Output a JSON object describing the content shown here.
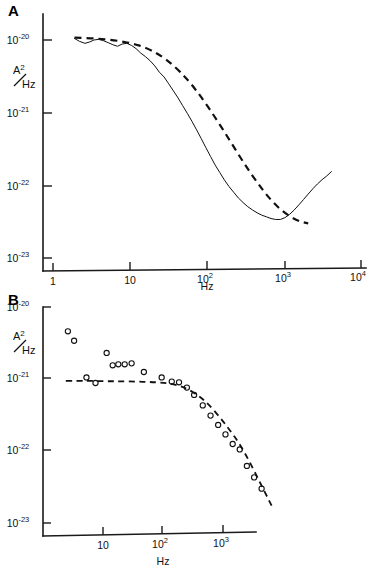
{
  "figure": {
    "background": "#ffffff",
    "ink_color": "#111111"
  },
  "panels": [
    {
      "id": "A",
      "letter": "A",
      "ylabel_numerator": "A",
      "ylabel_numerator_sup": "2",
      "ylabel_denominator": "Hz",
      "xlabel": "Hz",
      "y_tick_labels": [
        "-20",
        "-21",
        "-22",
        "-23"
      ],
      "y_tick_base": "10",
      "x_tick_labels": [
        "1",
        "10",
        "10",
        "10",
        "10"
      ],
      "x_tick_exponents": [
        "",
        "",
        "2",
        "3",
        "4"
      ]
    },
    {
      "id": "B",
      "letter": "B",
      "ylabel_numerator": "A",
      "ylabel_numerator_sup": "2",
      "ylabel_denominator": "Hz",
      "xlabel": "Hz",
      "y_tick_labels": [
        "-20",
        "-21",
        "-22",
        "-23"
      ],
      "y_tick_base": "10",
      "x_tick_labels": [
        "10",
        "10",
        "10"
      ],
      "x_tick_exponents": [
        "",
        "2",
        "3"
      ]
    }
  ],
  "chart_data": [
    {
      "type": "line",
      "panel": "A",
      "title": "A",
      "xlabel": "Hz",
      "ylabel": "A^2/Hz",
      "xscale": "log",
      "yscale": "log",
      "xlim": [
        1,
        10000
      ],
      "ylim": [
        1e-23,
        1e-20
      ],
      "x_ticks": [
        1,
        10,
        100,
        1000,
        10000
      ],
      "y_ticks": [
        1e-20,
        1e-21,
        1e-22,
        1e-23
      ],
      "grid": false,
      "legend": "none",
      "series": [
        {
          "name": "measured spectrum",
          "style": "solid-noisy",
          "x": [
            1.9,
            2.2,
            2.6,
            3.0,
            3.4,
            3.9,
            4.5,
            5.2,
            6.0,
            6.9,
            7.9,
            9.1,
            10.5,
            12.0,
            13.8,
            15.9,
            18.2,
            21.0,
            24.1,
            27.7,
            31.8,
            36.6,
            42.0,
            48.3,
            55.5,
            63.8,
            73.3,
            84.2,
            96.8,
            111.2,
            127.8,
            146.9,
            168.8,
            194.0,
            223.0,
            256.2,
            294.4,
            338.3,
            388.8,
            446.8,
            513.4,
            590.0,
            678.0,
            779.1,
            895.4,
            1029.0,
            1182.5,
            1358.9,
            1561.6,
            1794.6,
            2062.3,
            2370.0,
            2723.5,
            3129.8,
            3596.6,
            4133.0
          ],
          "y": [
            1.05e-20,
            9.6e-21,
            9e-21,
            9.4e-21,
            1e-20,
            1.02e-20,
            9.8e-21,
            9.2e-21,
            8.6e-21,
            8.2e-21,
            8.8e-21,
            9e-21,
            8.4e-21,
            7.6e-21,
            6.6e-21,
            5.9e-21,
            5.2e-21,
            4.4e-21,
            3.6e-21,
            3.1e-21,
            2.5e-21,
            2e-21,
            1.6e-21,
            1.25e-21,
            9.8e-22,
            7.6e-22,
            5.8e-22,
            4.4e-22,
            3.3e-22,
            2.5e-22,
            1.9e-22,
            1.5e-22,
            1.18e-22,
            9.6e-23,
            8e-23,
            6.7e-23,
            5.8e-23,
            5.1e-23,
            4.6e-23,
            4.2e-23,
            3.9e-23,
            3.7e-23,
            3.5e-23,
            3.4e-23,
            3.4e-23,
            3.6e-23,
            4e-23,
            4.6e-23,
            5.4e-23,
            6.4e-23,
            7.6e-23,
            9e-23,
            1.05e-22,
            1.2e-22,
            1.35e-22,
            1.55e-22
          ]
        },
        {
          "name": "lorentzian fit",
          "style": "dashed",
          "x": [
            1.9,
            3.0,
            4.5,
            6.9,
            10.5,
            15.9,
            24.1,
            36.6,
            55.5,
            84.2,
            127.8,
            194.0,
            294.4,
            446.8,
            678.0,
            1029.0,
            1561.6,
            2062.3
          ],
          "y": [
            1.08e-20,
            1.06e-20,
            1.03e-20,
            9.8e-21,
            9e-21,
            7.9e-21,
            6.3e-21,
            4.5e-21,
            2.9e-21,
            1.65e-21,
            8.6e-22,
            4.3e-22,
            2.1e-22,
            1.1e-22,
            6.2e-23,
            4.1e-23,
            3.2e-23,
            3e-23
          ]
        }
      ]
    },
    {
      "type": "scatter",
      "panel": "B",
      "title": "B",
      "xlabel": "Hz",
      "ylabel": "A^2/Hz",
      "xscale": "log",
      "yscale": "log",
      "xlim": [
        2,
        8000
      ],
      "ylim": [
        1e-23,
        1e-20
      ],
      "x_ticks": [
        10,
        100,
        1000
      ],
      "y_ticks": [
        1e-20,
        1e-21,
        1e-22,
        1e-23
      ],
      "grid": false,
      "legend": "none",
      "series": [
        {
          "name": "measured points",
          "style": "open-circles",
          "x": [
            2.6,
            3.3,
            5.3,
            7.5,
            11.5,
            14.5,
            18.0,
            23.0,
            30.0,
            48.0,
            95.0,
            140.0,
            185.0,
            250.0,
            330.0,
            460.0,
            620.0,
            830.0,
            1100.0,
            1450.0,
            1900.0,
            2500.0,
            3300.0,
            4400.0
          ],
          "y": [
            4.6e-21,
            3.4e-21,
            1.05e-21,
            8.8e-22,
            2.3e-21,
            1.55e-21,
            1.6e-21,
            1.6e-21,
            1.65e-21,
            1.25e-21,
            1.05e-21,
            9.2e-22,
            9e-22,
            7.6e-22,
            6e-22,
            4.3e-22,
            3.1e-22,
            2.3e-22,
            1.7e-22,
            1.25e-22,
            1.05e-22,
            6.2e-23,
            4.3e-23,
            3e-23
          ]
        },
        {
          "name": "lorentzian fit",
          "style": "dashed",
          "x": [
            2.4,
            4.0,
            7.0,
            12.0,
            20.0,
            35.0,
            60.0,
            100.0,
            160.0,
            250.0,
            400.0,
            600.0,
            900.0,
            1300.0,
            1900.0,
            2700.0,
            3800.0,
            5200.0,
            6800.0
          ],
          "y": [
            9.4e-22,
            9.4e-22,
            9.4e-22,
            9.3e-22,
            9.3e-22,
            9.2e-22,
            9.1e-22,
            8.9e-22,
            8.4e-22,
            7.4e-22,
            5.8e-22,
            4.3e-22,
            2.9e-22,
            1.95e-22,
            1.25e-22,
            7.4e-23,
            4.2e-23,
            2.5e-23,
            1.6e-23
          ]
        }
      ]
    }
  ]
}
